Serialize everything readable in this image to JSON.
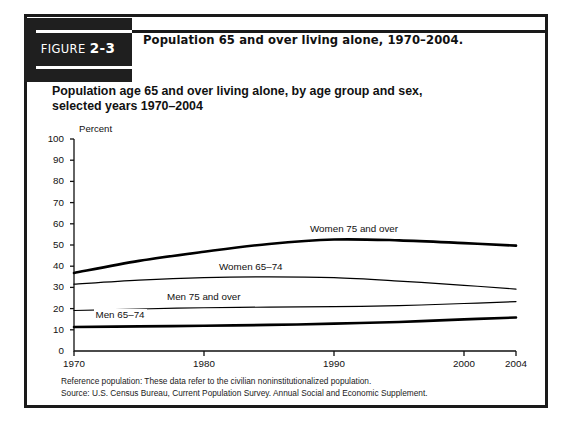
{
  "figure": {
    "badge_word": "FIGURE",
    "badge_number": "2-3",
    "title": "Population 65 and over living alone, 1970–2004."
  },
  "chart": {
    "subtitle": "Population age 65 and over living alone, by age group and sex, selected years 1970–2004",
    "y_unit": "Percent"
  },
  "footnotes": {
    "reference": "Reference population: These data refer to the civilian noninstitutionalized population.",
    "source": "Source: U.S. Census Bureau, Current Population Survey. Annual Social and Economic Supplement."
  },
  "colors": {
    "ink": "#111111",
    "frame": "#1a1a1a",
    "badge_bg": "#1f1f1f",
    "badge_fg": "#ffffff",
    "plot_line": "#000000"
  },
  "chart_data": {
    "type": "line",
    "title": "Population age 65 and over living alone, by age group and sex, selected years 1970–2004",
    "xlabel": "",
    "ylabel": "Percent",
    "xlim": [
      1970,
      2004
    ],
    "ylim": [
      0,
      100
    ],
    "ytick_labels": [
      "0",
      "10",
      "20",
      "30",
      "40",
      "50",
      "60",
      "70",
      "80",
      "90",
      "100"
    ],
    "yticks": [
      0,
      10,
      20,
      30,
      40,
      50,
      60,
      70,
      80,
      90,
      100
    ],
    "xtick_labels": [
      "1970",
      "1980",
      "1990",
      "2000",
      "2004"
    ],
    "xticks": [
      1970,
      1980,
      1990,
      2000,
      2004
    ],
    "grid": false,
    "legend": "inline-labels",
    "x": [
      1970,
      1975,
      1980,
      1985,
      1990,
      1995,
      2000,
      2004
    ],
    "series": [
      {
        "name": "Women 75 and over",
        "values": [
          36.8,
          42.5,
          46.8,
          50.5,
          52.6,
          52.2,
          50.9,
          49.7
        ],
        "line_weight": "thick",
        "label_x": 1988,
        "label_y": 57
      },
      {
        "name": "Women 65–74",
        "values": [
          31.5,
          33.4,
          34.6,
          35.0,
          34.6,
          33.0,
          31.0,
          29.2
        ],
        "line_weight": "thin",
        "label_x": 1981,
        "label_y": 39
      },
      {
        "name": "Men 75 and over",
        "values": [
          19.1,
          19.8,
          20.4,
          20.7,
          20.9,
          21.4,
          22.4,
          23.3
        ],
        "line_weight": "thin",
        "label_x": 1977,
        "label_y": 25
      },
      {
        "name": "Men 65–74",
        "values": [
          11.3,
          11.6,
          11.9,
          12.3,
          12.9,
          13.7,
          14.9,
          15.8
        ],
        "line_weight": "thick",
        "label_x": 1971.5,
        "label_y": 16.5
      }
    ]
  }
}
